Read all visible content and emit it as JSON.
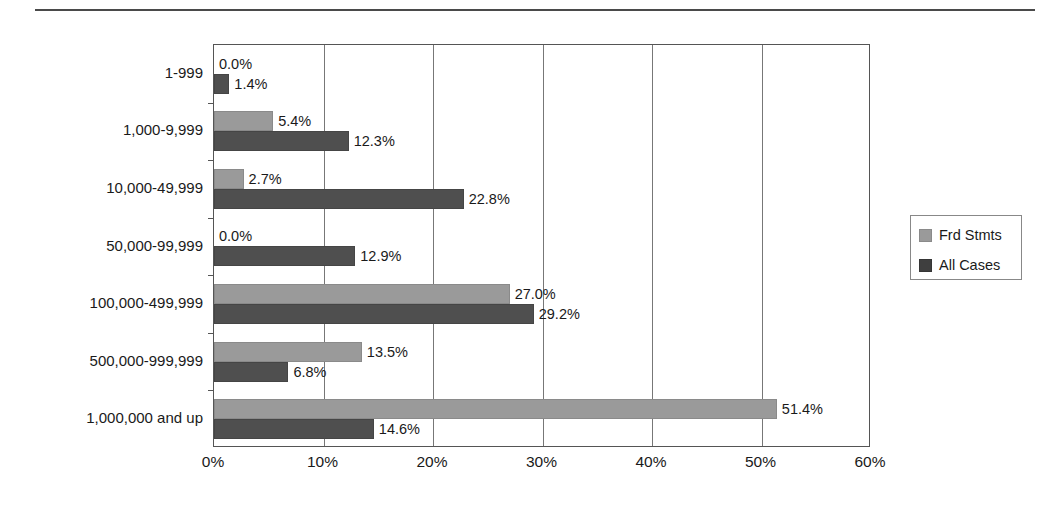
{
  "chart_data": {
    "type": "bar",
    "orientation": "horizontal",
    "title": "",
    "subtitle": "",
    "xlabel": "",
    "ylabel": "",
    "xlim": [
      0,
      60
    ],
    "ylim": null,
    "grid": true,
    "legend_position": "right",
    "x_tick_labels": [
      "0%",
      "10%",
      "20%",
      "30%",
      "40%",
      "50%",
      "60%"
    ],
    "x_tick_values": [
      0,
      10,
      20,
      30,
      40,
      50,
      60
    ],
    "categories": [
      "1-999",
      "1,000-9,999",
      "10,000-49,999",
      "50,000-99,999",
      "100,000-499,999",
      "500,000-999,999",
      "1,000,000 and up"
    ],
    "series": [
      {
        "name": "Frd Stmts",
        "color": "#9a9a9a",
        "values": [
          0.0,
          5.4,
          2.7,
          0.0,
          27.0,
          13.5,
          51.4
        ],
        "labels": [
          "0.0%",
          "5.4%",
          "2.7%",
          "0.0%",
          "27.0%",
          "13.5%",
          "51.4%"
        ]
      },
      {
        "name": "All Cases",
        "color": "#4f4f4f",
        "values": [
          1.4,
          12.3,
          22.8,
          12.9,
          29.2,
          6.8,
          14.6
        ],
        "labels": [
          "1.4%",
          "12.3%",
          "22.8%",
          "12.9%",
          "29.2%",
          "6.8%",
          "14.6%"
        ]
      }
    ]
  },
  "legend": {
    "entries": [
      {
        "label": "Frd Stmts",
        "color": "#9a9a9a"
      },
      {
        "label": "All Cases",
        "color": "#3f3f3f"
      }
    ]
  }
}
